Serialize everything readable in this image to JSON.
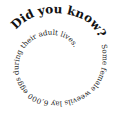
{
  "spiral": {
    "heading": "Did you know?",
    "body": "Some female weevils lay 6,000 eggs during their adult lives.",
    "text_color": "#111111",
    "background": "#ffffff"
  }
}
